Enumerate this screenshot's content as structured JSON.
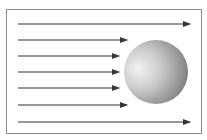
{
  "diagram": {
    "type": "flow-around-sphere",
    "frame": {
      "x": 6,
      "y": 9,
      "width": 196,
      "height": 125,
      "stroke": "#8a8a8a"
    },
    "arrow_color": "#333333",
    "arrows": [
      {
        "y": 24,
        "x_start": 18,
        "x_end": 190
      },
      {
        "y": 40,
        "x_start": 18,
        "x_end": 127
      },
      {
        "y": 56,
        "x_start": 18,
        "x_end": 119
      },
      {
        "y": 72,
        "x_start": 18,
        "x_end": 119
      },
      {
        "y": 88,
        "x_start": 18,
        "x_end": 119
      },
      {
        "y": 105,
        "x_start": 18,
        "x_end": 127
      },
      {
        "y": 122,
        "x_start": 18,
        "x_end": 190
      }
    ],
    "sphere": {
      "cx": 156,
      "cy": 72,
      "r": 32,
      "highlight": "#f4f4f4",
      "mid": "#c8c8c8",
      "shadow": "#7a7a7a"
    }
  }
}
